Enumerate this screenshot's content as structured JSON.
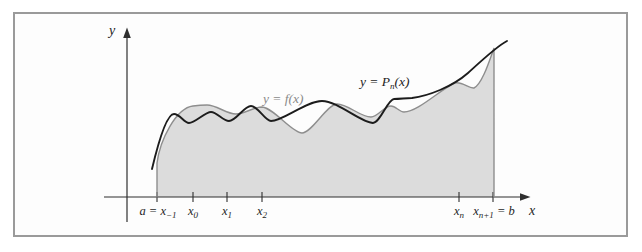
{
  "figure": {
    "y_axis_label": "y",
    "x_axis_label": "x",
    "curve_f_label": "y = f(x)",
    "curve_p": {
      "pre": "y = P",
      "sub": "n",
      "post": "(x)"
    },
    "ticks": [
      {
        "pre": "a = ",
        "base": "x",
        "sub": "−1",
        "post": ""
      },
      {
        "pre": "",
        "base": "x",
        "sub": "0",
        "post": ""
      },
      {
        "pre": "",
        "base": "x",
        "sub": "1",
        "post": ""
      },
      {
        "pre": "",
        "base": "x",
        "sub": "2",
        "post": ""
      },
      {
        "pre": "",
        "base": "x",
        "sub": "n",
        "post": ""
      },
      {
        "pre": "",
        "base": "x",
        "sub": "n+1",
        "post": " = b"
      }
    ]
  },
  "colors": {
    "shade": "#dcdcdc",
    "f_curve": "#8e8e8e",
    "p_curve": "#1c1c1c",
    "axis": "#2f2f2f",
    "frame_border": "#9a9a9a",
    "f_label": "#8a8a8a",
    "background": "#ffffff"
  },
  "svg": {
    "shade_path": "M157,197 L157,163 C160,140 176,108 193,106 C198,105.3 202,105 207,105 C217,105 226,114 236,114 C245,114 253,107 262,107 C274,108 292,133 302,133 C312,133 327,104 337,104 C348,104 360,117 371,117 C378,117 384,106 391,106 C396,106 399,112 404,112 C418,112 442,88 455,83 C462,81 469,89 474,88 C482,84 489,62 494,48 L494,197 Z",
    "f_outline_path": "M157,197 L157,163 C160,140 176,108 193,106 C198,105.3 202,105 207,105 C217,105 226,114 236,114 C245,114 253,107 262,107 C274,108 292,133 302,133 C312,133 327,104 337,104 C348,104 360,117 371,117 C378,117 384,106 391,106 C396,106 399,112 404,112 C418,112 442,88 455,83 C462,81 469,89 474,88 C482,84 489,62 494,48 L494,197",
    "p_curve_path": "M152,169 C157,148 166,114 174,114 C180,114 184,123 189,123 C195,123 205,112 211,112 C217,112 223,121 229,121 C236,121 244,106 251,106 C258,106 265,121 271,121 C283,121 306,101 322,101 C338,101 361,123 373,123 C380,123 388,99 394,99 C400,99 406,98 412,98 C428,96 452,87 468,73 C479,63 497,46 507,41",
    "x_axis_path": "M104,197 L521,197",
    "y_axis_path": "M127,222 L127,37",
    "ticks_path": "M157,192 L157,202 M193,192 L193,202 M227,192 L227,202 M262,192 L262,202 M459,192 L459,202 M493,192 L493,202",
    "x_arrow_path": "M530.5,197 L520,193.2 L520,200.8 Z",
    "y_arrow_path": "M127,27.5 L123.2,38 L130.8,38 Z"
  }
}
